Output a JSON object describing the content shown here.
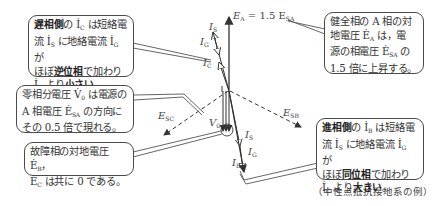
{
  "callouts": {
    "lag_side": {
      "line1_bold": "遅相側",
      "line1_rest": "の İ",
      "line1_sub": "C",
      "line1_tail": " は短絡電",
      "line2_a": "流 İ",
      "line2_sub1": "S",
      "line2_b": " に地絡電流 İ",
      "line2_sub2": "G",
      "line2_c": " が",
      "line3_a": "ほぼ",
      "line3_bold": "逆位相",
      "line3_b": "で加わり",
      "line4_a": "İ",
      "line4_sub": "B",
      "line4_b": " より",
      "line4_bold": "小さい",
      "line4_c": "。"
    },
    "healthy_phase": {
      "line1": "健全相の A 相の対",
      "line2_a": "地電圧 Ė",
      "line2_sub": "A",
      "line2_b": " は，電",
      "line3_a": "源の相電圧 Ė",
      "line3_sub": "SA",
      "line3_b": " の",
      "line4": "1.5 倍に上昇する。"
    },
    "zero_seq": {
      "line1_a": "零相分電圧 V̇",
      "line1_sub": "0",
      "line1_b": " は電源の",
      "line2_a": "A 相電圧 Ė",
      "line2_sub": "SA",
      "line2_b": " の方向に",
      "line3": "その 0.5 倍で現れる。"
    },
    "faulted_phase": {
      "line1_a": "故障相の対地電圧 Ė",
      "line1_sub": "B",
      "line1_b": "，",
      "line2_a": "Ė",
      "line2_sub": "C",
      "line2_b": " は共に 0 である。"
    },
    "lead_side": {
      "line1_bold": "進相側",
      "line1_rest": "の İ",
      "line1_sub": "B",
      "line1_tail": " は短絡電",
      "line2_a": "流 İ",
      "line2_sub1": "S",
      "line2_b": " に地絡電流 İ",
      "line2_sub2": "G",
      "line2_c": " が",
      "line3_a": "ほぼ",
      "line3_bold": "同位相",
      "line3_b": "で加わり",
      "line4_a": "İ",
      "line4_sub": "C",
      "line4_b": " より",
      "line4_bold": "大きい",
      "line4_c": "。"
    }
  },
  "labels": {
    "EA": {
      "main": "E",
      "sub": "A",
      "rest": " = 1.5 E",
      "sub2": "SA"
    },
    "IS_top": {
      "main": "I",
      "sub": "S"
    },
    "IG_top": {
      "main": "I",
      "sub": "G"
    },
    "IC": {
      "main": "I",
      "sub": "C"
    },
    "ESC": {
      "main": "E",
      "sub": "SC"
    },
    "ESB": {
      "main": "E",
      "sub": "SB"
    },
    "V0": {
      "main": "V",
      "sub": "0"
    },
    "IS_bot": {
      "main": "I",
      "sub": "S"
    },
    "IG_bot": {
      "main": "I",
      "sub": "G"
    },
    "IB": {
      "main": "I",
      "sub": "B"
    }
  },
  "caption": "（中性点抵抗接地系の例）",
  "colors": {
    "line": "#333333",
    "border": "#4a4a4a",
    "background": "#ffffff"
  }
}
